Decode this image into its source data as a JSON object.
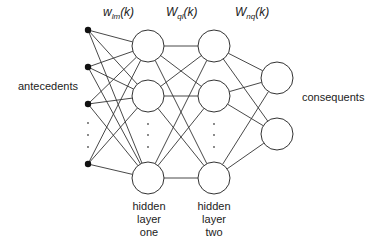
{
  "diagram": {
    "type": "neural-network",
    "weights": [
      {
        "symbol": "w",
        "sub": "lm",
        "arg": "(k)"
      },
      {
        "symbol": "W",
        "sub": "ql",
        "arg": "(k)"
      },
      {
        "symbol": "W",
        "sub": "nq",
        "arg": "(k)"
      }
    ],
    "labels": {
      "inputs": "antecedents",
      "outputs": "consequents",
      "hidden_one": [
        "hidden",
        "layer",
        "one"
      ],
      "hidden_two": [
        "hidden",
        "layer",
        "two"
      ]
    },
    "layers": {
      "input": {
        "x": 88,
        "nodes": [
          30,
          67,
          104,
          164
        ],
        "ellipsis": [
          123,
          135,
          147
        ]
      },
      "hidden_one": {
        "x": 148,
        "nodes": [
          46,
          96,
          178
        ],
        "r": 16,
        "ellipsis": [
          124,
          135,
          147
        ]
      },
      "hidden_two": {
        "x": 214,
        "nodes": [
          46,
          96,
          178
        ],
        "r": 16,
        "ellipsis": [
          124,
          135,
          147
        ]
      },
      "output": {
        "x": 277,
        "nodes": [
          78,
          134
        ],
        "r": 16
      }
    }
  }
}
